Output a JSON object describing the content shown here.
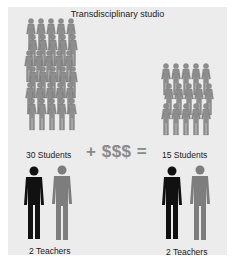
{
  "title": "Transdisciplinary studio",
  "left": {
    "students_label": "30 Students",
    "teachers_label": "2 Teachers",
    "student_rows": 6,
    "student_cols": 5
  },
  "right": {
    "students_label": "15 Students",
    "teachers_label": "2 Teachers",
    "student_rows": 3,
    "student_cols": 5
  },
  "equation": {
    "plus": "+",
    "money": "$$$",
    "equals": "="
  },
  "colors": {
    "panel_bg": "#ececec",
    "student_fill": "#8d8d8d",
    "teacher_dark": "#111111",
    "teacher_gray": "#7d7d7d",
    "equation": "#8a8a8a"
  }
}
